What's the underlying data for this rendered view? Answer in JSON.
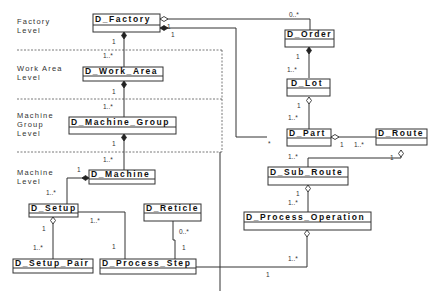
{
  "diagram": {
    "type": "UML class diagram",
    "levels": [
      {
        "id": "factory",
        "label_line1": "Factory",
        "label_line2": "Level"
      },
      {
        "id": "work_area",
        "label_line1": "Work Area",
        "label_line2": "Level"
      },
      {
        "id": "machine_group",
        "label_line1": "Machine",
        "label_line2": "Group",
        "label_line3": "Level"
      },
      {
        "id": "machine",
        "label_line1": "Machine",
        "label_line2": "Level"
      }
    ],
    "classes": {
      "factory": "D_Factory",
      "work_area": "D_Work_Area",
      "machine_group": "D_Machine_Group",
      "machine": "D_Machine",
      "setup": "D_Setup",
      "setup_pair": "D_Setup_Pair",
      "reticle": "D_Reticle",
      "process_step": "D_Process_Step",
      "order": "D_Order",
      "lot": "D_Lot",
      "part": "D_Part",
      "route": "D_Route",
      "sub_route": "D_Sub_Route",
      "process_operation": "D_Process_Operation"
    },
    "multiplicities": {
      "factory_order_order_end": "0..*",
      "factory_part_factory_end_a": "1",
      "factory_part_factory_end_b": "1",
      "factory_workarea_factory_end": "1",
      "factory_workarea_wa_end": "1..*",
      "workarea_mg_wa_end": "1",
      "workarea_mg_mg_end": "1..*",
      "mg_machine_mg_end": "1",
      "mg_machine_machine_end": "1..*",
      "machine_setup_machine_end": "1",
      "machine_setup_setup_end": "1..*",
      "setup_pair_setup_end": "1",
      "setup_pair_pair_end": "1..*",
      "setup_step_setup_end": "1..*",
      "setup_step_step_end": "1",
      "reticle_step_reticle_end": "0..*",
      "reticle_step_step_end": "1",
      "order_lot_order_end": "1",
      "order_lot_lot_end": "1..*",
      "lot_part_lot_end": "1",
      "lot_part_part_end": "1..*",
      "part_factory_part_end": "*",
      "part_route_part_end": "1",
      "part_route_route_end": "1..*",
      "part_subroute_part_end": "1..*",
      "route_subroute_route_end": "1",
      "subroute_op_subroute_end": "1",
      "subroute_op_op_end": "1..*",
      "op_step_op_end": "1..*",
      "op_step_step_end": "1"
    }
  }
}
